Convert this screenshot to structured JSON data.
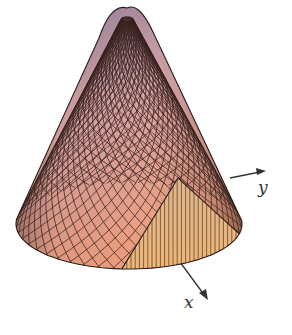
{
  "figure": {
    "surface": "cone",
    "axes": [
      {
        "name": "x",
        "label": "x"
      },
      {
        "name": "y",
        "label": "y"
      }
    ],
    "colors": {
      "apex": "#8e7d98",
      "mid": "#d6a4a8",
      "base": "#ee9f7e",
      "wedge_top": "#e0b68c",
      "wedge_bottom": "#f0b676",
      "mesh": "#3a2320",
      "axis": "#333333",
      "background": "#ffffff"
    }
  }
}
